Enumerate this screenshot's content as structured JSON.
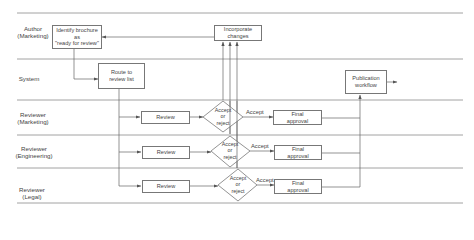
{
  "diagram": {
    "type": "swimlane-flowchart",
    "lanes": [
      {
        "label_line1": "Author",
        "label_line2": "(Marketing)"
      },
      {
        "label_line1": "System",
        "label_line2": ""
      },
      {
        "label_line1": "Reviewer",
        "label_line2": "(Marketing)"
      },
      {
        "label_line1": "Reviewer",
        "label_line2": "(Engineering)"
      },
      {
        "label_line1": "Reviewer",
        "label_line2": "(Legal)"
      }
    ],
    "nodes": {
      "identify": {
        "line1": "Identify brochure",
        "line2": "as",
        "line3": "\"ready for review\""
      },
      "incorporate": {
        "line1": "Incorporate",
        "line2": "changes"
      },
      "route": {
        "line1": "Route to",
        "line2": "review list"
      },
      "publication": {
        "line1": "Publication",
        "line2": "workflow"
      },
      "review_marketing": {
        "label": "Review"
      },
      "review_engineering": {
        "label": "Review"
      },
      "review_legal": {
        "label": "Review"
      },
      "decision_marketing": {
        "line1": "Accept",
        "line2": "or",
        "line3": "reject"
      },
      "decision_engineering": {
        "line1": "Accept",
        "line2": "or",
        "line3": "reject"
      },
      "decision_legal": {
        "line1": "Accept",
        "line2": "or",
        "line3": "reject"
      },
      "final_marketing": {
        "line1": "Final",
        "line2": "approval"
      },
      "final_engineering": {
        "line1": "Final",
        "line2": "approval"
      },
      "final_legal": {
        "line1": "Final",
        "line2": "approval"
      }
    },
    "edge_labels": {
      "accept_marketing": "Accept",
      "accept_engineering": "Accept",
      "accept_legal": "Accept"
    },
    "colors": {
      "line": "#777777",
      "text": "#444444",
      "background": "#ffffff"
    }
  }
}
